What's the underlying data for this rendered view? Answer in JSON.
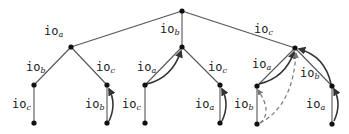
{
  "diagram": {
    "type": "tree",
    "nodes": [
      {
        "id": "r",
        "x": 182,
        "y": 11
      },
      {
        "id": "a",
        "x": 71,
        "y": 47
      },
      {
        "id": "b",
        "x": 182,
        "y": 47
      },
      {
        "id": "c",
        "x": 295,
        "y": 48
      },
      {
        "id": "ab",
        "x": 34,
        "y": 85
      },
      {
        "id": "ac",
        "x": 107,
        "y": 85
      },
      {
        "id": "ba",
        "x": 145,
        "y": 85
      },
      {
        "id": "bc",
        "x": 220,
        "y": 85
      },
      {
        "id": "ca",
        "x": 257,
        "y": 86
      },
      {
        "id": "cb",
        "x": 332,
        "y": 86
      },
      {
        "id": "abc",
        "x": 34,
        "y": 123
      },
      {
        "id": "acb",
        "x": 107,
        "y": 123
      },
      {
        "id": "bac",
        "x": 145,
        "y": 123
      },
      {
        "id": "bca",
        "x": 220,
        "y": 123
      },
      {
        "id": "cab",
        "x": 257,
        "y": 124
      },
      {
        "id": "cba",
        "x": 332,
        "y": 124
      }
    ],
    "edges": [
      {
        "from": "r",
        "to": "a",
        "label": "io",
        "sub": "a",
        "lx": 44,
        "ly": 35
      },
      {
        "from": "r",
        "to": "b",
        "label": "io",
        "sub": "b",
        "lx": 160,
        "ly": 33
      },
      {
        "from": "r",
        "to": "c",
        "label": "io",
        "sub": "c",
        "lx": 254,
        "ly": 33
      },
      {
        "from": "a",
        "to": "ab",
        "label": "io",
        "sub": "b",
        "lx": 26,
        "ly": 71
      },
      {
        "from": "a",
        "to": "ac",
        "label": "io",
        "sub": "c",
        "lx": 96,
        "ly": 71
      },
      {
        "from": "b",
        "to": "ba",
        "label": "io",
        "sub": "a",
        "lx": 137,
        "ly": 71
      },
      {
        "from": "b",
        "to": "bc",
        "label": "io",
        "sub": "c",
        "lx": 208,
        "ly": 71
      },
      {
        "from": "c",
        "to": "ca",
        "label": "io",
        "sub": "a",
        "lx": 252,
        "ly": 68
      },
      {
        "from": "c",
        "to": "cb",
        "label": "io",
        "sub": "b",
        "lx": 300,
        "ly": 77
      },
      {
        "from": "ab",
        "to": "abc",
        "label": "io",
        "sub": "c",
        "lx": 12,
        "ly": 108
      },
      {
        "from": "ac",
        "to": "acb",
        "label": "io",
        "sub": "b",
        "lx": 85,
        "ly": 108
      },
      {
        "from": "ba",
        "to": "bac",
        "label": "io",
        "sub": "c",
        "lx": 122,
        "ly": 108
      },
      {
        "from": "bc",
        "to": "bca",
        "label": "io",
        "sub": "a",
        "lx": 195,
        "ly": 108
      },
      {
        "from": "ca",
        "to": "cab",
        "label": "io",
        "sub": "b",
        "lx": 234,
        "ly": 108
      },
      {
        "from": "cb",
        "to": "cba",
        "label": "io",
        "sub": "a",
        "lx": 306,
        "ly": 108
      }
    ],
    "arrows": [
      {
        "d": "M 109 121 Q 117 104 109 89",
        "style": "solid"
      },
      {
        "d": "M 147 84 Q 172 78 181 51",
        "style": "solid"
      },
      {
        "d": "M 222 121 Q 230 104 222 89",
        "style": "solid"
      },
      {
        "d": "M 259 84 Q 285 78 294 52",
        "style": "solid"
      },
      {
        "d": "M 331 84 Q 325 56 299 49",
        "style": "solid"
      },
      {
        "d": "M 334 121 Q 342 104 334 89",
        "style": "solid"
      },
      {
        "d": "M 260 123 Q 273 112 258 90",
        "style": "dashed"
      },
      {
        "d": "M 260 123 Q 293 106 296 53",
        "style": "dashed"
      }
    ],
    "colors": {
      "edge": "#555555",
      "node": "#111111",
      "arrow": "#333333",
      "dashed": "#777777"
    }
  }
}
